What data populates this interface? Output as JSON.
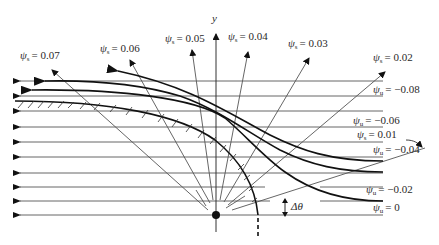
{
  "figure": {
    "axis_label_y": "y",
    "delta_theta_label": "Δθ",
    "psi_symbol": "ψ",
    "subscript_s": "s",
    "subscript_u": "u"
  },
  "stream_labels_s": [
    {
      "id": "psi-s-0.07",
      "sub": "s",
      "value": "= 0.07"
    },
    {
      "id": "psi-s-0.06",
      "sub": "s",
      "value": "= 0.06"
    },
    {
      "id": "psi-s-0.05",
      "sub": "s",
      "value": "= 0.05"
    },
    {
      "id": "psi-s-0.04",
      "sub": "s",
      "value": "= 0.04"
    },
    {
      "id": "psi-s-0.03",
      "sub": "s",
      "value": "= 0.03"
    },
    {
      "id": "psi-s-0.02",
      "sub": "s",
      "value": "= 0.02"
    },
    {
      "id": "psi-s-0.01",
      "sub": "s",
      "value": "= 0.01"
    }
  ],
  "stream_labels_u": [
    {
      "id": "psi-u--0.08",
      "sub": "u",
      "value": "= −0.08"
    },
    {
      "id": "psi-u--0.06",
      "sub": "u",
      "value": "= −0.06"
    },
    {
      "id": "psi-u--0.04",
      "sub": "u",
      "value": "= −0.04"
    },
    {
      "id": "psi-u--0.02",
      "sub": "u",
      "value": "= −0.02"
    },
    {
      "id": "psi-u-0",
      "sub": "u",
      "value": "= 0"
    }
  ],
  "colors": {
    "thin_line": "#555555",
    "thick_line": "#111111",
    "text": "#2a2a2a",
    "background": "#ffffff"
  }
}
